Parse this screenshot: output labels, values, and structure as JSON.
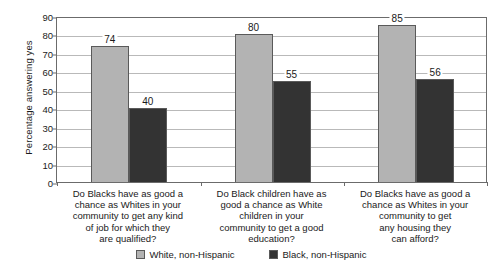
{
  "chart_data": {
    "type": "bar",
    "title": "",
    "subtitle": "",
    "xlabel": "",
    "ylabel": "Percentage answering yes",
    "ylim": [
      0,
      90
    ],
    "ytick_step": 10,
    "yticks": [
      "0",
      "10",
      "20",
      "30",
      "40",
      "50",
      "60",
      "70",
      "80",
      "90"
    ],
    "grid": true,
    "legend_position": "bottom",
    "categories": [
      "Do Blacks have as good a chance as Whites in your community to get any kind of job for which they are qualified?",
      "Do Black children have as good a chance as White children in your community to get a good education?",
      "Do Blacks have as good a chance as Whites in your community to get any housing they can afford?"
    ],
    "category_lines": [
      [
        "Do Blacks have as good a",
        "chance as Whites in your",
        "community to get any kind",
        "of job for which they",
        "are qualified?"
      ],
      [
        "Do Black children have as",
        "good a chance as White",
        "children in your",
        "community to get a good",
        "education?"
      ],
      [
        "Do Blacks have as good a",
        "chance as Whites in your",
        "community to get",
        "any housing they",
        "can afford?"
      ]
    ],
    "series": [
      {
        "name": "White, non-Hispanic",
        "color": "#b3b3b3",
        "values": [
          74,
          80,
          85
        ]
      },
      {
        "name": "Black, non-Hispanic",
        "color": "#333333",
        "values": [
          40,
          55,
          56
        ]
      }
    ],
    "value_labels": [
      "74",
      "40",
      "80",
      "55",
      "85",
      "56"
    ]
  },
  "legend": {
    "items": [
      {
        "label": "White, non-Hispanic"
      },
      {
        "label": "Black, non-Hispanic"
      }
    ]
  },
  "colors": {
    "series_white": "#b3b3b3",
    "series_black": "#333333",
    "axis": "#6b6b6b",
    "gridline": "#b9b9b9",
    "background": "#ffffff",
    "text": "#1a1a1a"
  }
}
